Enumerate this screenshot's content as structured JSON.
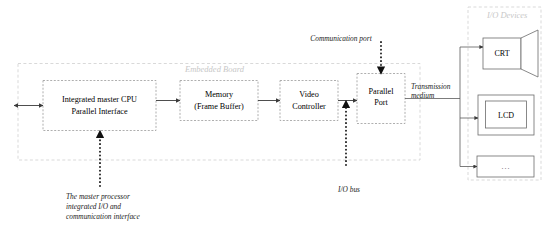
{
  "diagram": {
    "regions": [
      {
        "id": "embedded-board",
        "label": "Embedded Board"
      },
      {
        "id": "io-devices",
        "label": "I/O Devices"
      }
    ],
    "blocks": [
      {
        "id": "cpu",
        "line1": "Integrated master CPU",
        "line2": "Parallel Interface",
        "style": "dashed"
      },
      {
        "id": "memory",
        "line1": "Memory",
        "line2": "(Frame Buffer)",
        "style": "dashed"
      },
      {
        "id": "video-controller",
        "line1": "Video",
        "line2": "Controller",
        "style": "dashed"
      },
      {
        "id": "parallel-port",
        "line1": "Parallel",
        "line2": "Port",
        "style": "dashed"
      },
      {
        "id": "crt",
        "line1": "CRT",
        "line2": "",
        "style": "solid"
      },
      {
        "id": "lcd",
        "line1": "LCD",
        "line2": "",
        "style": "solid"
      },
      {
        "id": "other-device",
        "line1": "...",
        "line2": "",
        "style": "solid"
      }
    ],
    "annotations": [
      {
        "id": "communication-port",
        "text": "Communication port"
      },
      {
        "id": "transmission-medium-line1",
        "text": "Transmission"
      },
      {
        "id": "transmission-medium-line2",
        "text": "medium"
      },
      {
        "id": "io-bus",
        "text": "I/O bus"
      }
    ],
    "caption": {
      "line1": "The master processor",
      "line2": "integrated I/O and",
      "line3": "communication interface"
    },
    "colors": {
      "background": "#ffffff",
      "solid_stroke": "#6b6b6b",
      "dashed_stroke": "#9a9a9a",
      "region_stroke": "#cfcfcf",
      "region_label": "#c8c8c8",
      "wire": "#3a3a3a",
      "text": "#000000"
    }
  }
}
